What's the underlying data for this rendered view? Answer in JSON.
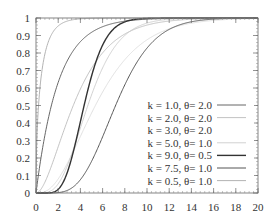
{
  "chart_data": {
    "type": "line",
    "title": "",
    "xlabel": "",
    "ylabel": "",
    "xlim": [
      0,
      20
    ],
    "ylim": [
      0,
      1
    ],
    "x_ticks": [
      "0",
      "2",
      "4",
      "6",
      "8",
      "10",
      "12",
      "14",
      "16",
      "18",
      "20"
    ],
    "y_ticks": [
      "0",
      "0.1",
      "0.2",
      "0.3",
      "0.4",
      "0.5",
      "0.6",
      "0.7",
      "0.8",
      "0.9",
      "1"
    ],
    "grid": false,
    "legend_position": "lower right",
    "function": "Gamma CDF",
    "series": [
      {
        "name": "k = 1.0, θ= 2.0",
        "k": 1.0,
        "theta": 2.0,
        "color": "#555555",
        "width": 0.9
      },
      {
        "name": "k = 2.0, θ= 2.0",
        "k": 2.0,
        "theta": 2.0,
        "color": "#bbbbbb",
        "width": 0.9
      },
      {
        "name": "k = 3.0, θ= 2.0",
        "k": 3.0,
        "theta": 2.0,
        "color": "#ffffff",
        "width": 0.9
      },
      {
        "name": "k = 5.0, θ= 1.0",
        "k": 5.0,
        "theta": 1.0,
        "color": "#cccccc",
        "width": 0.9
      },
      {
        "name": "k = 9.0, θ= 0.5",
        "k": 9.0,
        "theta": 0.5,
        "color": "#333333",
        "width": 1.4
      },
      {
        "name": "k = 7.5, θ= 1.0",
        "k": 7.5,
        "theta": 1.0,
        "color": "#555555",
        "width": 1.0
      },
      {
        "name": "k = 0.5, θ= 1.0",
        "k": 0.5,
        "theta": 1.0,
        "color": "#aaaaaa",
        "width": 0.9
      }
    ]
  }
}
